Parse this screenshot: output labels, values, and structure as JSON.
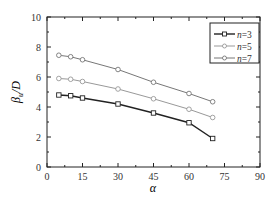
{
  "chart_data": {
    "type": "line",
    "title": "",
    "xlabel": "α",
    "ylabel": "β_u/D",
    "xlim": [
      0,
      90
    ],
    "ylim": [
      0,
      10
    ],
    "xticks": [
      0,
      15,
      30,
      45,
      60,
      75,
      90
    ],
    "yticks": [
      0,
      2,
      4,
      6,
      8,
      10
    ],
    "grid": false,
    "legend_position": "upper right",
    "x": [
      5,
      10,
      15,
      30,
      45,
      60,
      70
    ],
    "series": [
      {
        "name": "n=3",
        "marker": "square",
        "color": "#222222",
        "values": [
          4.8,
          4.75,
          4.6,
          4.2,
          3.6,
          2.95,
          1.9
        ]
      },
      {
        "name": "n=5",
        "marker": "circle",
        "color": "#999999",
        "values": [
          5.9,
          5.85,
          5.7,
          5.2,
          4.55,
          3.85,
          3.3
        ]
      },
      {
        "name": "n=7",
        "marker": "circle",
        "color": "#777777",
        "values": [
          7.45,
          7.35,
          7.15,
          6.5,
          5.65,
          4.9,
          4.35
        ]
      }
    ]
  },
  "legend": {
    "items": [
      "n=3",
      "n=5",
      "n=7"
    ]
  }
}
